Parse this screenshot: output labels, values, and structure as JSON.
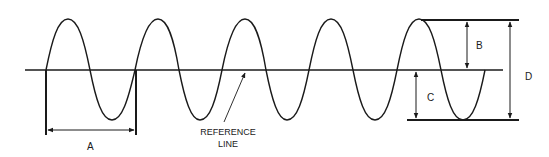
{
  "diagram": {
    "type": "sine-wave-dimensions",
    "colors": {
      "line": "#1a1a1a",
      "background": "#ffffff"
    },
    "labels": {
      "a": "A",
      "b": "B",
      "c": "C",
      "d": "D",
      "reference_line_1": "REFERENCE",
      "reference_line_2": "LINE"
    },
    "annotations": {
      "A": "wavelength / period between two zero crossings",
      "B": "reference line to positive peak",
      "C": "reference line to negative peak",
      "D": "peak-to-peak"
    },
    "wave": {
      "cycles": 5,
      "reference_y": 70,
      "peak_y": 19,
      "trough_y": 120
    }
  }
}
